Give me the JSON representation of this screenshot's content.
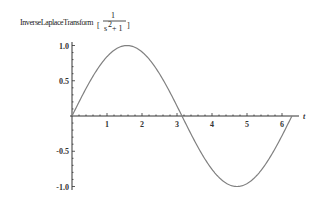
{
  "chart_data": {
    "type": "line",
    "title_parts": {
      "function": "InverseLaplaceTransform",
      "numerator": "1",
      "denominator_base": "s",
      "denominator_exp": "2",
      "denominator_rest": " + 1"
    },
    "xlabel": "t",
    "ylabel": "",
    "xlim": [
      0,
      6.2832
    ],
    "ylim": [
      -1.0,
      1.0
    ],
    "x_ticks": [
      1,
      2,
      3,
      4,
      5,
      6
    ],
    "x_tick_labels": [
      "1",
      "2",
      "3",
      "4",
      "5",
      "6"
    ],
    "y_ticks": [
      1.0,
      0.5,
      -0.5,
      -1.0
    ],
    "y_tick_labels": [
      "1.0",
      "0.5",
      "-0.5",
      "-1.0"
    ],
    "grid": false,
    "legend": null,
    "series": [
      {
        "name": "sin(t)",
        "color": "#808080",
        "x": [
          0,
          0.5,
          1.0,
          1.5708,
          2.0,
          2.5,
          3.1416,
          3.5,
          4.0,
          4.7124,
          5.0,
          5.5,
          6.0,
          6.2832
        ],
        "values": [
          0,
          0.479,
          0.841,
          1.0,
          0.909,
          0.598,
          0,
          -0.351,
          -0.757,
          -1.0,
          -0.959,
          -0.706,
          -0.279,
          0
        ]
      }
    ]
  },
  "colors": {
    "curve": "#808080",
    "axis": "#333333",
    "background": "#ffffff"
  }
}
